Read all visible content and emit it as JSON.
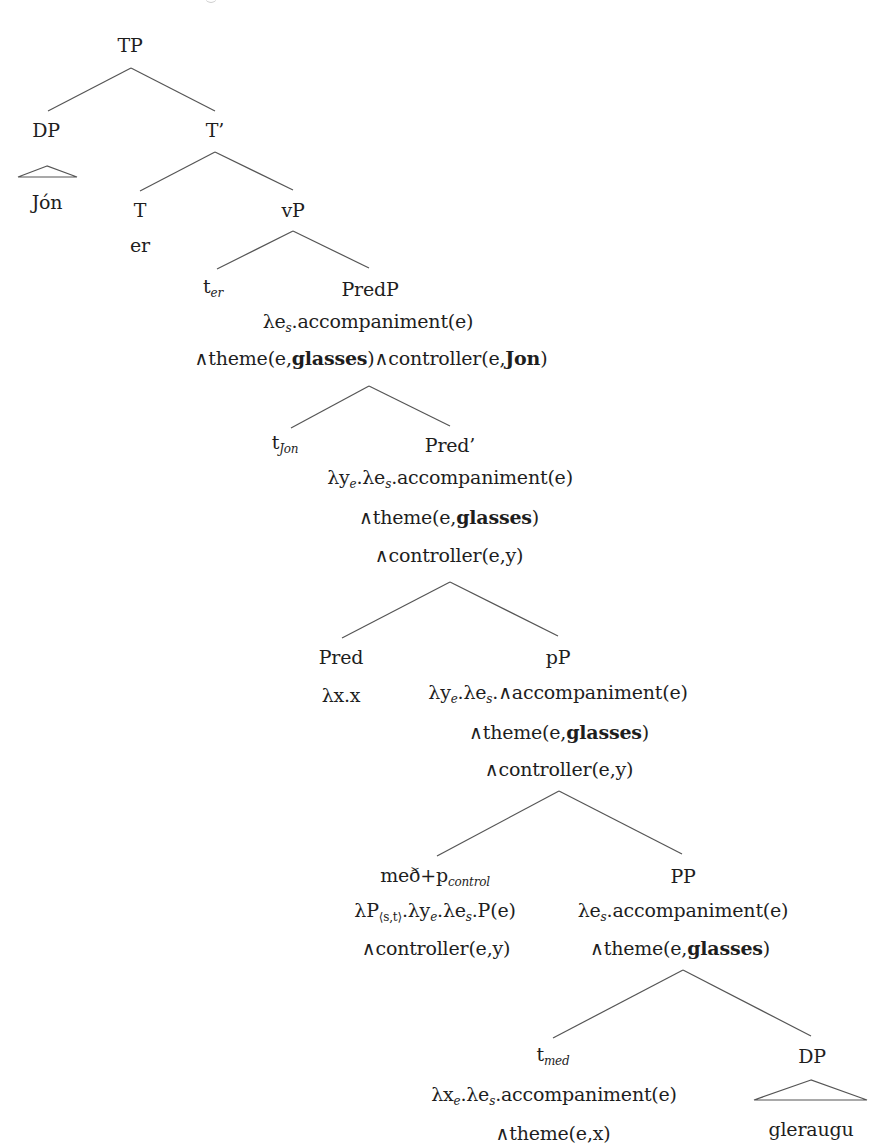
{
  "diagram": {
    "type": "syntax-tree",
    "colors": {
      "text": "#1e1e1e",
      "lines": "#555555",
      "background": "#ffffff"
    },
    "nodes": [
      {
        "id": "tp",
        "x": 130,
        "y": 55,
        "runs": [
          {
            "t": "TP"
          }
        ]
      },
      {
        "id": "dp-subject",
        "x": 46,
        "y": 140,
        "runs": [
          {
            "t": "DP"
          }
        ]
      },
      {
        "id": "jon",
        "x": 47,
        "y": 212,
        "runs": [
          {
            "t": "Jón"
          }
        ]
      },
      {
        "id": "t-bar",
        "x": 215,
        "y": 140,
        "runs": [
          {
            "t": "T’"
          }
        ]
      },
      {
        "id": "t-head",
        "x": 140,
        "y": 220,
        "runs": [
          {
            "t": "T"
          }
        ]
      },
      {
        "id": "er",
        "x": 140,
        "y": 255,
        "runs": [
          {
            "t": "er"
          }
        ]
      },
      {
        "id": "vp",
        "x": 293,
        "y": 220,
        "runs": [
          {
            "t": "vP"
          }
        ]
      },
      {
        "id": "trace-er",
        "x": 213,
        "y": 299,
        "runs": [
          {
            "t": "t"
          },
          {
            "t": "er",
            "sub": true
          }
        ]
      },
      {
        "id": "predp",
        "x": 370,
        "y": 299,
        "runs": [
          {
            "t": "PredP"
          }
        ]
      },
      {
        "id": "predp-sem-1",
        "x": 368,
        "y": 334,
        "runs": [
          {
            "t": "λe"
          },
          {
            "t": "s",
            "sub": true
          },
          {
            "t": ".accompaniment(e)"
          }
        ]
      },
      {
        "id": "predp-sem-2",
        "x": 371,
        "y": 368,
        "runs": [
          {
            "t": "∧theme(e,"
          },
          {
            "t": "glasses",
            "bold": true
          },
          {
            "t": ")∧controller(e,"
          },
          {
            "t": "Jon",
            "bold": true
          },
          {
            "t": ")"
          }
        ]
      },
      {
        "id": "trace-jon",
        "x": 285,
        "y": 455,
        "runs": [
          {
            "t": "t"
          },
          {
            "t": "Jon",
            "sub": true
          }
        ]
      },
      {
        "id": "pred-bar",
        "x": 450,
        "y": 455,
        "runs": [
          {
            "t": "Pred’"
          }
        ]
      },
      {
        "id": "pred-bar-sem-1",
        "x": 450,
        "y": 490,
        "runs": [
          {
            "t": "λy"
          },
          {
            "t": "e",
            "sub": true
          },
          {
            "t": ".λe"
          },
          {
            "t": "s",
            "sub": true
          },
          {
            "t": ".accompaniment(e)"
          }
        ]
      },
      {
        "id": "pred-bar-sem-2",
        "x": 449,
        "y": 527,
        "runs": [
          {
            "t": "∧theme(e,"
          },
          {
            "t": "glasses",
            "bold": true
          },
          {
            "t": ")"
          }
        ]
      },
      {
        "id": "pred-bar-sem-3",
        "x": 449,
        "y": 565,
        "runs": [
          {
            "t": "∧controller(e,y)"
          }
        ]
      },
      {
        "id": "pred-head",
        "x": 341,
        "y": 667,
        "runs": [
          {
            "t": "Pred"
          }
        ]
      },
      {
        "id": "pred-head-sem",
        "x": 341,
        "y": 705,
        "runs": [
          {
            "t": "λx.x"
          }
        ]
      },
      {
        "id": "pp-little",
        "x": 558,
        "y": 667,
        "runs": [
          {
            "t": "pP"
          }
        ]
      },
      {
        "id": "pp-little-sem-1",
        "x": 558,
        "y": 705,
        "runs": [
          {
            "t": "λy"
          },
          {
            "t": "e",
            "sub": true
          },
          {
            "t": ".λe"
          },
          {
            "t": "s",
            "sub": true
          },
          {
            "t": ".∧accompaniment(e)"
          }
        ]
      },
      {
        "id": "pp-little-sem-2",
        "x": 559,
        "y": 742,
        "runs": [
          {
            "t": "∧theme(e,"
          },
          {
            "t": "glasses",
            "bold": true
          },
          {
            "t": ")"
          }
        ]
      },
      {
        "id": "pp-little-sem-3",
        "x": 559,
        "y": 779,
        "runs": [
          {
            "t": "∧controller(e,y)"
          }
        ]
      },
      {
        "id": "med-p-control",
        "x": 435,
        "y": 888,
        "runs": [
          {
            "t": "með+p"
          },
          {
            "t": "control",
            "sub": true
          }
        ]
      },
      {
        "id": "med-p-control-sem-1",
        "x": 435,
        "y": 923,
        "runs": [
          {
            "t": "λP"
          },
          {
            "t": "⟨s,t⟩",
            "sub": true
          },
          {
            "t": ".λy"
          },
          {
            "t": "e",
            "sub": true
          },
          {
            "t": ".λe"
          },
          {
            "t": "s",
            "sub": true
          },
          {
            "t": ".P(e)"
          }
        ]
      },
      {
        "id": "med-p-control-sem-2",
        "x": 436,
        "y": 958,
        "runs": [
          {
            "t": "∧controller(e,y)"
          }
        ]
      },
      {
        "id": "pp",
        "x": 683,
        "y": 886,
        "runs": [
          {
            "t": "PP"
          }
        ]
      },
      {
        "id": "pp-sem-1",
        "x": 683,
        "y": 923,
        "runs": [
          {
            "t": "λe"
          },
          {
            "t": "s",
            "sub": true
          },
          {
            "t": ".accompaniment(e)"
          }
        ]
      },
      {
        "id": "pp-sem-2",
        "x": 680,
        "y": 958,
        "runs": [
          {
            "t": "∧theme(e,"
          },
          {
            "t": "glasses",
            "bold": true
          },
          {
            "t": ")"
          }
        ]
      },
      {
        "id": "trace-med",
        "x": 553,
        "y": 1067,
        "runs": [
          {
            "t": "t"
          },
          {
            "t": "med",
            "sub": true
          }
        ]
      },
      {
        "id": "trace-med-sem-1",
        "x": 554,
        "y": 1107,
        "runs": [
          {
            "t": "λx"
          },
          {
            "t": "e",
            "sub": true
          },
          {
            "t": ".λe"
          },
          {
            "t": "s",
            "sub": true
          },
          {
            "t": ".accompaniment(e)"
          }
        ]
      },
      {
        "id": "trace-med-sem-2",
        "x": 553,
        "y": 1143,
        "runs": [
          {
            "t": "∧theme(e,x)"
          }
        ]
      },
      {
        "id": "dp-object",
        "x": 812,
        "y": 1066,
        "runs": [
          {
            "t": "DP"
          }
        ]
      },
      {
        "id": "gleraugu",
        "x": 811,
        "y": 1139,
        "runs": [
          {
            "t": "gleraugu"
          }
        ]
      }
    ],
    "edges": [
      [
        131,
        68,
        48,
        111
      ],
      [
        131,
        68,
        215,
        111
      ],
      [
        215,
        152,
        140,
        191
      ],
      [
        215,
        152,
        293,
        190
      ],
      [
        293,
        231,
        217,
        269
      ],
      [
        293,
        231,
        369,
        268
      ],
      [
        369,
        386,
        291,
        428
      ],
      [
        369,
        386,
        450,
        426
      ],
      [
        450,
        582,
        342,
        638
      ],
      [
        450,
        582,
        558,
        636
      ],
      [
        559,
        791,
        437,
        856
      ],
      [
        559,
        791,
        682,
        854
      ],
      [
        683,
        970,
        553,
        1038
      ],
      [
        683,
        970,
        811,
        1036
      ]
    ],
    "triangles": [
      {
        "id": "dp-subject-triangle",
        "apex": [
          47,
          166
        ],
        "base_left": [
          18,
          177
        ],
        "base_right": [
          77,
          177
        ]
      },
      {
        "id": "dp-object-triangle",
        "apex": [
          811,
          1080
        ],
        "base_left": [
          754,
          1100
        ],
        "base_right": [
          867,
          1100
        ]
      }
    ]
  }
}
